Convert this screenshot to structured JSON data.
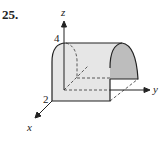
{
  "figure": {
    "problem_number": "25.",
    "axes": {
      "x_label": "x",
      "y_label": "y",
      "z_label": "z"
    },
    "ticks": {
      "z_value": "4",
      "x_value": "2"
    },
    "shape": "half-cylinder surface (parabolic cross-section) extending along the y-axis",
    "colors": {
      "surface_front": "#e6e6e6",
      "surface_end": "#bdbdbd",
      "outline": "#222222"
    }
  }
}
